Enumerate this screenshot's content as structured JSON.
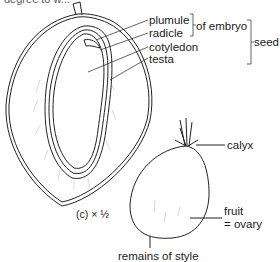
{
  "caption_cut": "degree to w...",
  "section_label": "(c) × ½",
  "labels": {
    "plumule": "plumule",
    "radicle": "radicle",
    "of_embryo": "of embryo",
    "cotyledon": "cotyledon",
    "testa": "testa",
    "seed": "seed",
    "calyx": "calyx",
    "fruit": "fruit",
    "ovary": "= ovary",
    "style": "remains of style"
  }
}
